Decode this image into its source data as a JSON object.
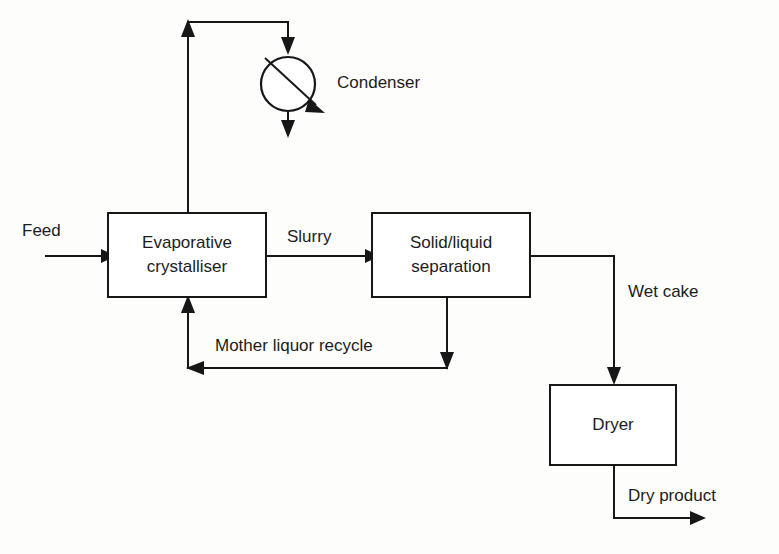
{
  "diagram": {
    "kind": "process-flow-diagram",
    "background_color": "#fdfdfc",
    "line_color": "#171717",
    "text_color": "#1c1c1c",
    "units": [
      {
        "id": "evaporative-crystalliser",
        "shape": "rectangle",
        "label_line_1": "Evaporative",
        "label_line_2": "crystalliser",
        "x": 108,
        "y": 213,
        "width": 158,
        "height": 84
      },
      {
        "id": "solid-liquid-separation",
        "shape": "rectangle",
        "label_line_1": "Solid/liquid",
        "label_line_2": "separation",
        "x": 372,
        "y": 213,
        "width": 158,
        "height": 84
      },
      {
        "id": "dryer",
        "shape": "rectangle",
        "label_line_1": "Dryer",
        "label_line_2": "",
        "x": 550,
        "y": 385,
        "width": 126,
        "height": 80
      },
      {
        "id": "condenser",
        "shape": "circle-with-diagonal",
        "label_line_1": "Condenser",
        "label_line_2": "",
        "cx": 288,
        "cy": 84,
        "r": 27
      }
    ],
    "streams": [
      {
        "id": "feed",
        "label": "Feed",
        "label_x": 22,
        "label_y": 232
      },
      {
        "id": "slurry",
        "label": "Slurry",
        "label_x": 287,
        "label_y": 238
      },
      {
        "id": "wet-cake",
        "label": "Wet cake",
        "label_x": 628,
        "label_y": 293
      },
      {
        "id": "mother-liquor-recycle",
        "label": "Mother liquor recycle",
        "label_x": 215,
        "label_y": 347
      },
      {
        "id": "dry-product",
        "label": "Dry product",
        "label_x": 628,
        "label_y": 497
      },
      {
        "id": "condenser-label",
        "label": "Condenser",
        "label_x": 337,
        "label_y": 84
      }
    ]
  }
}
